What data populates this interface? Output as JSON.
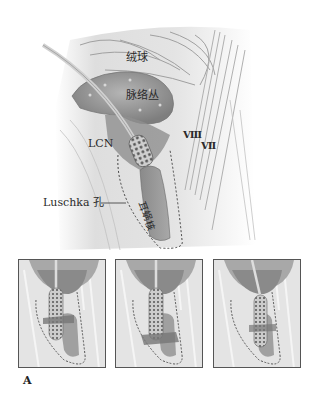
{
  "figure": {
    "label": "A",
    "main_labels": {
      "flocculus": "绒球",
      "choroid_plexus": "脉络丛",
      "lcn": "LCN",
      "cn_viii": "Ⅷ",
      "cn_vii": "Ⅶ",
      "foramen_luschka": "Luschka 孔",
      "cochlear_nucleus": "耳蜗核"
    },
    "panels": [
      {
        "id": "panel-1",
        "description": "electrode paddle horizontal rotation"
      },
      {
        "id": "panel-2",
        "description": "electrode paddle lateral displacement"
      },
      {
        "id": "panel-3",
        "description": "electrode paddle deep insertion"
      }
    ],
    "colors": {
      "background": "#ffffff",
      "tissue_light": "#e6e6e6",
      "tissue_mid": "#bdbdbd",
      "tissue_dark": "#8a8a8a",
      "plexus": "#9a9a9a",
      "dashed_outline": "#333333",
      "panel_border": "#555555"
    }
  }
}
